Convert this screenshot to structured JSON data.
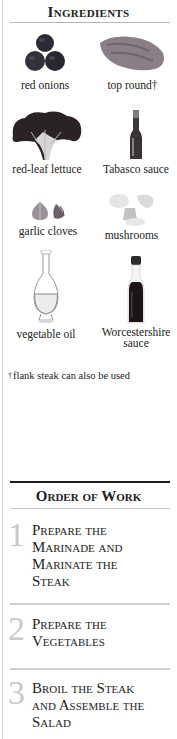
{
  "ingredients": {
    "title": "Ingredients",
    "items": [
      {
        "label": "red onions",
        "icon": "red-onions-image"
      },
      {
        "label": "top round†",
        "icon": "top-round-steak-image"
      },
      {
        "label": "red-leaf lettuce",
        "icon": "red-leaf-lettuce-image"
      },
      {
        "label": "Tabasco sauce",
        "icon": "tabasco-bottle-image"
      },
      {
        "label": "garlic cloves",
        "icon": "garlic-cloves-image"
      },
      {
        "label": "mushrooms",
        "icon": "mushrooms-image"
      },
      {
        "label": "vegetable oil",
        "icon": "oil-carafe-image"
      },
      {
        "label": "Worcestershire",
        "label_line2": "sauce",
        "icon": "worcestershire-bottle-image"
      }
    ],
    "footnote_mark": "†",
    "footnote": "flank steak can also be used"
  },
  "order_of_work": {
    "title": "Order of Work",
    "steps": [
      {
        "number": "1",
        "lines": [
          "Prepare the",
          "Marinade and",
          "Marinate the",
          "Steak"
        ]
      },
      {
        "number": "2",
        "lines": [
          "Prepare the",
          "Vegetables"
        ]
      },
      {
        "number": "3",
        "lines": [
          "Broil the Steak",
          "and Assemble the",
          "Salad"
        ]
      }
    ]
  },
  "colors": {
    "text": "#1e1e1e",
    "step_number": "#c9c9c9",
    "rule_dark": "#1a1a1a",
    "rule_light": "#cfcfcf"
  }
}
